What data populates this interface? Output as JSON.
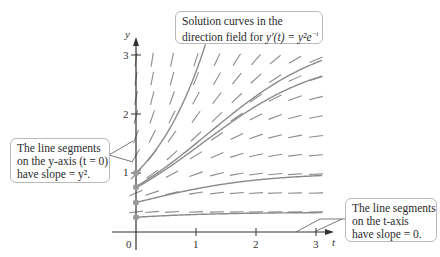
{
  "figure": {
    "title_callout": {
      "line1": "Solution curves in the",
      "line2_prefix": "direction field for ",
      "equation": "y′(t) = y²e",
      "exponent": "−t"
    },
    "yaxis_callout": {
      "line1": "The line segments",
      "line2": "on the y-axis (t = 0)",
      "line3": "have slope = y²."
    },
    "taxis_callout": {
      "line1": "The line segments",
      "line2": "on the t-axis",
      "line3": "have slope = 0."
    },
    "axes": {
      "x_label": "t",
      "y_label": "y",
      "x_ticks": [
        "0",
        "1",
        "2",
        "3"
      ],
      "y_ticks": [
        "1",
        "2",
        "3"
      ]
    },
    "colors": {
      "axis": "#333333",
      "segment": "#8c8c8c",
      "curve": "#8a8a8a",
      "dot": "#9a9a9a",
      "callout_border": "#b9b9b9"
    }
  },
  "chart_data": {
    "type": "direction_field",
    "xlabel": "t",
    "ylabel": "y",
    "xlim": [
      0,
      3.2
    ],
    "ylim": [
      0,
      3.1
    ],
    "x_ticks": [
      0,
      1,
      2,
      3
    ],
    "y_ticks": [
      1,
      2,
      3
    ],
    "field_columns_t": [
      0.27,
      0.6,
      1.0,
      1.35,
      1.68,
      2.0,
      2.32,
      2.65,
      3.0
    ],
    "field_rows_y": [
      0.34,
      0.66,
      0.98,
      1.3,
      1.62,
      1.95,
      2.27,
      2.6,
      2.92
    ],
    "solution_curves": [
      {
        "y0": 1.0,
        "formula": "y = e^t"
      },
      {
        "y0": 0.77,
        "formula": "y = 1/(1/y0 - 1 + e^-t)"
      },
      {
        "y0": 0.75,
        "formula": "y = 1/(1/y0 - 1 + e^-t)"
      },
      {
        "y0": 0.5,
        "formula": "y = 1/(1 + e^-t)"
      },
      {
        "y0": 0.25,
        "formula": "y = 1/(3 + e^-t)"
      }
    ],
    "initial_points_y": [
      1.0,
      0.76,
      0.5,
      0.25
    ],
    "annotations": [
      "The line segments on the y-axis (t = 0) have slope = y^2.",
      "The line segments on the t-axis have slope = 0."
    ]
  }
}
